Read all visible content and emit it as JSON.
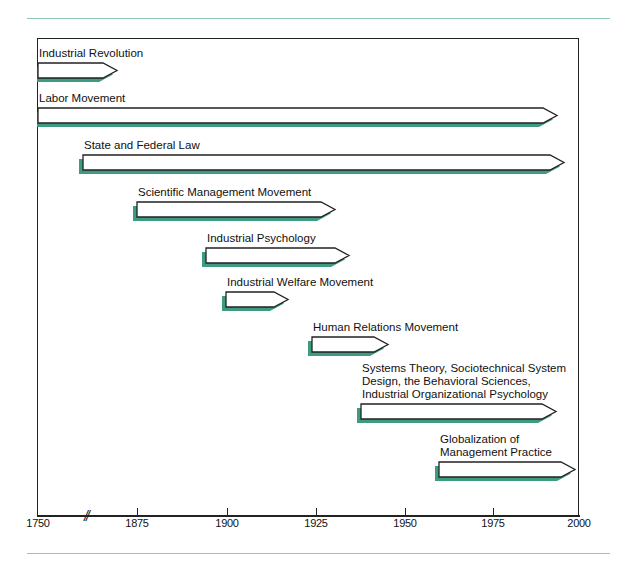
{
  "colors": {
    "accent_rule": "#8fc8bb",
    "shadow": "#3e9b82",
    "stroke": "#222222",
    "fill": "#ffffff"
  },
  "axis": {
    "ticks": [
      {
        "label": "1750",
        "x": 38
      },
      {
        "label": "1875",
        "x": 137
      },
      {
        "label": "1900",
        "x": 227
      },
      {
        "label": "1925",
        "x": 316
      },
      {
        "label": "1950",
        "x": 405
      },
      {
        "label": "1975",
        "x": 493
      },
      {
        "label": "2000",
        "x": 579
      }
    ],
    "break_mark": "//"
  },
  "bars": [
    {
      "label": "Industrial Revolution",
      "start": 1750,
      "end": 1870,
      "x1": 38,
      "x2": 117,
      "y": 63,
      "label_lines": [
        "Industrial Revolution"
      ]
    },
    {
      "label": "Labor Movement",
      "start": 1750,
      "end": 1995,
      "x1": 38,
      "x2": 557,
      "y": 108,
      "label_lines": [
        "Labor Movement"
      ]
    },
    {
      "label": "State and Federal Law",
      "start": 1860,
      "end": 1997,
      "x1": 83,
      "x2": 564,
      "y": 155,
      "label_lines": [
        "State and Federal Law"
      ]
    },
    {
      "label": "Scientific Management Movement",
      "start": 1875,
      "end": 1930,
      "x1": 137,
      "x2": 335,
      "y": 202,
      "label_lines": [
        "Scientific Management Movement"
      ]
    },
    {
      "label": "Industrial Psychology",
      "start": 1894,
      "end": 1934,
      "x1": 206,
      "x2": 349,
      "y": 248,
      "label_lines": [
        "Industrial Psychology"
      ]
    },
    {
      "label": "Industrial Welfare Movement",
      "start": 1900,
      "end": 1917,
      "x1": 226,
      "x2": 288,
      "y": 292,
      "label_lines": [
        "Industrial Welfare Movement"
      ]
    },
    {
      "label": "Human Relations Movement",
      "start": 1924,
      "end": 1945,
      "x1": 312,
      "x2": 388,
      "y": 337,
      "label_lines": [
        "Human Relations Movement"
      ]
    },
    {
      "label": "Systems Theory, Sociotechnical System Design, the Behavioral Sciences, Industrial Organizational Psychology",
      "start": 1938,
      "end": 1995,
      "x1": 361,
      "x2": 556,
      "y": 404,
      "label_lines": [
        "Systems Theory, Sociotechnical System",
        "Design, the Behavioral Sciences,",
        "Industrial Organizational Psychology"
      ]
    },
    {
      "label": "Globalization of Management Practice",
      "start": 1960,
      "end": 2000,
      "x1": 439,
      "x2": 575,
      "y": 462,
      "label_lines": [
        "Globalization of",
        "Management Practice"
      ]
    }
  ]
}
